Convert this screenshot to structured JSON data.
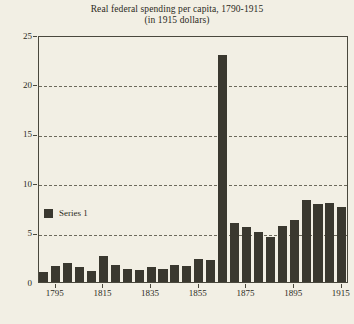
{
  "chart_data": {
    "type": "bar",
    "title": "Real federal spending per capita, 1790-1915",
    "subtitle": "(in 1915 dollars)",
    "xlabel": "",
    "ylabel": "",
    "ylim": [
      0,
      25
    ],
    "yticks": [
      0,
      5,
      10,
      15,
      20,
      25
    ],
    "ytick_labels": [
      "0",
      "5",
      "10",
      "15",
      "20",
      "25"
    ],
    "xtick_labels": [
      "1795",
      "1815",
      "1835",
      "1855",
      "1875",
      "1895",
      "1915"
    ],
    "xticks": [
      1795,
      1815,
      1835,
      1855,
      1875,
      1895,
      1915
    ],
    "xlim": [
      1788,
      1918
    ],
    "grid": "horizontal-dashed",
    "legend_position": "inside-left",
    "categories": [
      "1790",
      "1795",
      "1800",
      "1805",
      "1810",
      "1815",
      "1820",
      "1825",
      "1830",
      "1835",
      "1840",
      "1845",
      "1850",
      "1855",
      "1860",
      "1865",
      "1870",
      "1875",
      "1880",
      "1885",
      "1890",
      "1895",
      "1900",
      "1905",
      "1910",
      "1915"
    ],
    "series": [
      {
        "name": "Series 1",
        "color": "#3a382f",
        "values": [
          1.0,
          1.6,
          1.9,
          1.5,
          1.1,
          2.6,
          1.7,
          1.3,
          1.2,
          1.5,
          1.3,
          1.7,
          1.6,
          2.3,
          2.2,
          23.0,
          6.0,
          5.6,
          5.1,
          4.6,
          5.7,
          6.3,
          8.3,
          7.9,
          8.0,
          7.6
        ]
      }
    ]
  },
  "legend": {
    "entries": [
      {
        "label": "Series 1",
        "swatch_name": "series-1-swatch"
      }
    ]
  },
  "colors": {
    "background": "#f2efe4",
    "bar": "#3a382f",
    "axis": "#4a483d",
    "grid": "#6d6a5c",
    "text": "#2b2a22"
  }
}
